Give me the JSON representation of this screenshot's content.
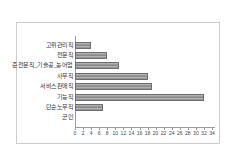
{
  "chart_data": {
    "type": "bar",
    "orientation": "horizontal",
    "title": "",
    "xlabel": "",
    "ylabel": "",
    "categories": [
      "고위관리직",
      "전문직",
      "준전문직_기술공_농어업",
      "사무직",
      "서비스판매직",
      "기능직",
      "단순노무직",
      "군인"
    ],
    "values": [
      4,
      8,
      11,
      18,
      19,
      32,
      7,
      0
    ],
    "xlim": [
      0,
      34
    ],
    "xticks": [
      0,
      2,
      4,
      6,
      8,
      10,
      12,
      14,
      16,
      18,
      20,
      22,
      24,
      26,
      28,
      30,
      32,
      34
    ],
    "grid": false,
    "legend": false,
    "colors": {
      "bar_fill": "#989898",
      "bar_border": "#6e6e6e",
      "axis": "#9a9a9a",
      "frame_border": "#cccccc",
      "background": "#ffffff",
      "label_text": "#333333",
      "tick_text": "#444444"
    }
  }
}
